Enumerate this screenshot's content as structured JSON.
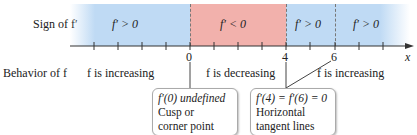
{
  "row_labels": {
    "sign": "Sign of f′",
    "behavior": "Behavior of f"
  },
  "intervals": [
    {
      "sign": "f′ > 0",
      "behavior": "f is increasing",
      "color": "#bfdaf4"
    },
    {
      "sign": "f′ < 0",
      "behavior": "f is decreasing",
      "color": "#f2b1ac"
    },
    {
      "sign": "f′ > 0",
      "behavior": "f is increasing",
      "color": "#bfdaf4"
    },
    {
      "sign": "f′ > 0",
      "color": "#bfdaf4"
    }
  ],
  "axis": {
    "variable": "x",
    "labels": [
      "0",
      "4",
      "6"
    ]
  },
  "callouts": [
    {
      "lines": [
        "f′(0) undefined",
        "Cusp or",
        "corner point"
      ]
    },
    {
      "lines": [
        "f′(4) = f′(6) = 0",
        "Horizontal",
        "tangent lines"
      ]
    }
  ]
}
